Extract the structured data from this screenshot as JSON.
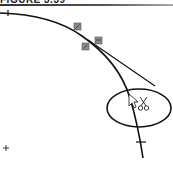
{
  "figure": {
    "title": "FIGURE 3.39"
  },
  "canvas": {
    "curve_color": "#111111",
    "marker_color": "#808080",
    "icons": {
      "cursor": "arrow-cursor-icon",
      "scissors": "scissors-icon",
      "crosshair": "plus-icon"
    },
    "elements": {
      "curve": "spline curve",
      "tangent_line": "line tangent to curve",
      "trim_region": "ellipse highlight"
    }
  }
}
